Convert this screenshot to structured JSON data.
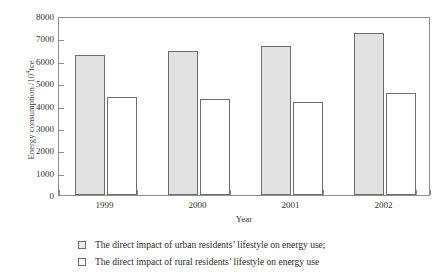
{
  "chart_data": {
    "type": "bar",
    "title": "",
    "xlabel": "Year",
    "ylabel": "Energy consumption /10",
    "ylabel_sup": "4",
    "ylabel_unit": "tce",
    "categories": [
      "1999",
      "2000",
      "2001",
      "2002"
    ],
    "ylim": [
      0,
      8000
    ],
    "yticks": [
      0,
      1000,
      2000,
      3000,
      4000,
      5000,
      6000,
      7000,
      8000
    ],
    "ytick_labels": [
      "0",
      "1000",
      "2000",
      "3000",
      "4000",
      "5000",
      "6000",
      "7000",
      "8000"
    ],
    "grid": false,
    "legend_position": "below",
    "series": [
      {
        "name": "The direct impact of urban residents' lifestyle on energy use;",
        "key": "urban",
        "color": "#e2e2e2",
        "edge_color": "#6d6d6d",
        "values": [
          6250,
          6450,
          6650,
          7250
        ]
      },
      {
        "name": "The direct impact of rural residents' lifestyle on energy use",
        "key": "rural",
        "color": "#ffffff",
        "edge_color": "#6d6d6d",
        "values": [
          4400,
          4300,
          4150,
          4550
        ]
      }
    ]
  },
  "legend": {
    "items": [
      {
        "label": "The direct impact of urban residents’ lifestyle on energy use;"
      },
      {
        "label": "The direct impact of rural residents’ lifestyle on energy use"
      }
    ]
  },
  "axes": {
    "frame_color": "#8e8e8e",
    "tick_color": "#8e8e8e"
  }
}
